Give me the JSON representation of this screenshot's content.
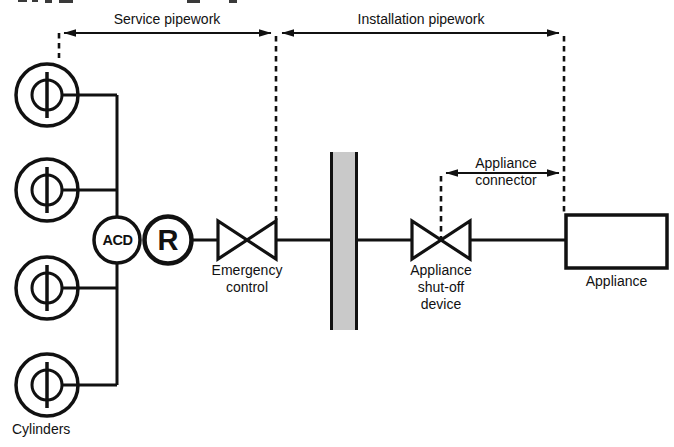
{
  "figure": {
    "labels": {
      "service_pipework": "Service pipework",
      "installation_pipework": "Installation pipework",
      "appliance_connector": "Appliance\nconnector",
      "emergency_control": "Emergency\ncontrol",
      "appliance_shutoff": "Appliance\nshut-off\ndevice",
      "appliance": "Appliance",
      "cylinders": "Cylinders",
      "acd": "ACD",
      "regulator": "R"
    },
    "colors": {
      "ink": "#111111",
      "wall_fill": "#c9c9c9"
    }
  }
}
